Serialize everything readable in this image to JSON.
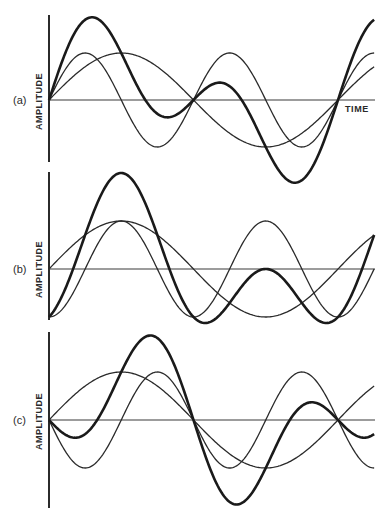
{
  "figure": {
    "colors": {
      "ink": "#2a2a2a",
      "background": "#ffffff"
    },
    "time_label": "TIME",
    "panels": [
      {
        "id": "a",
        "label": "(a)",
        "ylabel": "AMPLITUDE"
      },
      {
        "id": "b",
        "label": "(b)",
        "ylabel": "AMPLITUDE"
      },
      {
        "id": "c",
        "label": "(c)",
        "ylabel": "AMPLITUDE"
      }
    ]
  },
  "chart_data": [
    {
      "type": "line",
      "title": "(a)",
      "xlabel": "TIME",
      "ylabel": "AMPLITUDE",
      "grid": false,
      "description": "Fundamental plus second harmonic, both starting in sine phase; bold curve is their sum",
      "x_range_periods": [
        0,
        1.125
      ],
      "series": [
        {
          "name": "fundamental",
          "style": "thin",
          "amplitude": 1.0,
          "harmonic": 1,
          "phase": "sin"
        },
        {
          "name": "second harmonic",
          "style": "thin",
          "amplitude": 1.0,
          "harmonic": 2,
          "phase": "sin"
        },
        {
          "name": "sum",
          "style": "thick",
          "components": [
            "fundamental",
            "second harmonic"
          ]
        }
      ]
    },
    {
      "type": "line",
      "title": "(b)",
      "xlabel": "",
      "ylabel": "AMPLITUDE",
      "grid": false,
      "description": "Fundamental (sine) plus second harmonic shifted 90 degrees (negative cosine); bold curve is their sum",
      "x_range_periods": [
        0,
        1.125
      ],
      "series": [
        {
          "name": "fundamental",
          "style": "thin",
          "amplitude": 1.0,
          "harmonic": 1,
          "phase": "sin"
        },
        {
          "name": "second harmonic",
          "style": "thin",
          "amplitude": 1.0,
          "harmonic": 2,
          "phase": "-cos"
        },
        {
          "name": "sum",
          "style": "thick",
          "components": [
            "fundamental",
            "second harmonic"
          ]
        }
      ]
    },
    {
      "type": "line",
      "title": "(c)",
      "xlabel": "",
      "ylabel": "AMPLITUDE",
      "grid": false,
      "description": "Fundamental (sine) plus second harmonic inverted 180 degrees (negative sine); bold curve is their sum",
      "x_range_periods": [
        0,
        1.125
      ],
      "series": [
        {
          "name": "fundamental",
          "style": "thin",
          "amplitude": 1.0,
          "harmonic": 1,
          "phase": "sin"
        },
        {
          "name": "second harmonic",
          "style": "thin",
          "amplitude": 1.0,
          "harmonic": 2,
          "phase": "-sin"
        },
        {
          "name": "sum",
          "style": "thick",
          "components": [
            "fundamental",
            "second harmonic"
          ]
        }
      ]
    }
  ]
}
